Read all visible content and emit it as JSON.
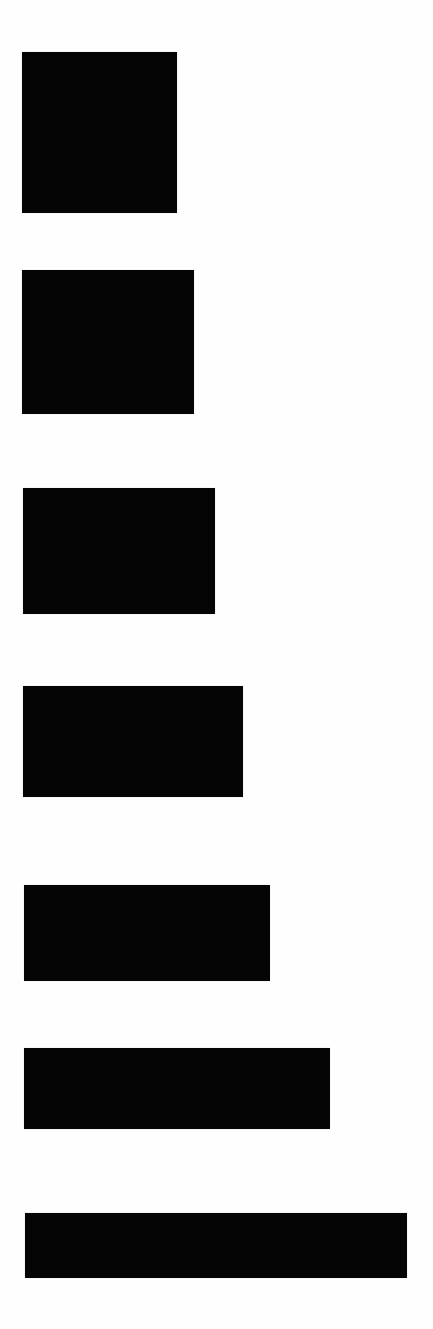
{
  "diagram": {
    "background_color": "#ffffff",
    "fill_color": "#050505",
    "shapes": [
      {
        "id": "rect-1",
        "x": 22,
        "y": 52,
        "width": 155,
        "height": 161
      },
      {
        "id": "rect-2",
        "x": 22,
        "y": 270,
        "width": 172,
        "height": 144
      },
      {
        "id": "rect-3",
        "x": 23,
        "y": 488,
        "width": 192,
        "height": 126
      },
      {
        "id": "rect-4",
        "x": 23,
        "y": 686,
        "width": 220,
        "height": 111
      },
      {
        "id": "rect-5",
        "x": 24,
        "y": 885,
        "width": 246,
        "height": 96
      },
      {
        "id": "rect-6",
        "x": 24,
        "y": 1048,
        "width": 306,
        "height": 81
      },
      {
        "id": "rect-7",
        "x": 25,
        "y": 1213,
        "width": 382,
        "height": 65
      }
    ]
  }
}
